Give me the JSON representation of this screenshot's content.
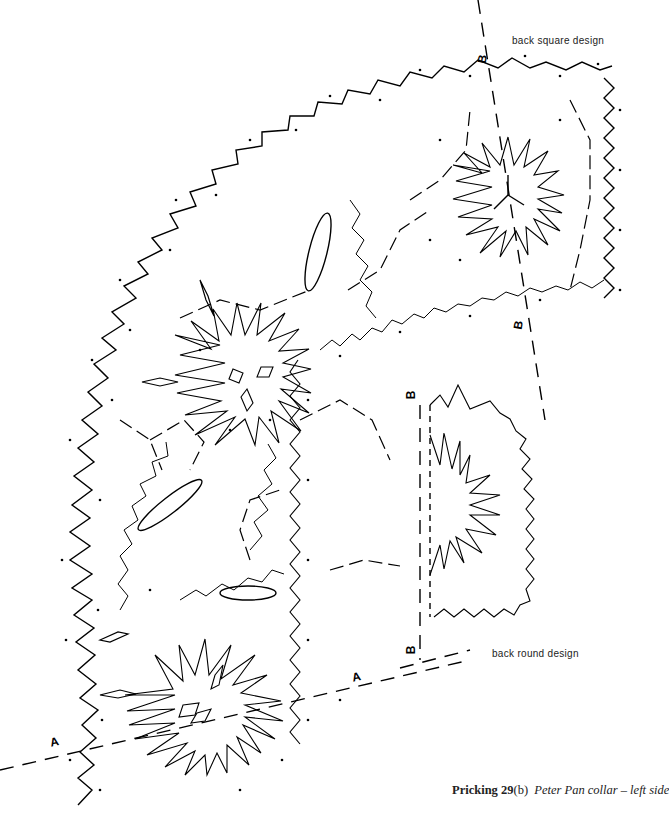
{
  "labels": {
    "back_square": "back square design",
    "back_round": "back round design"
  },
  "markers": {
    "a": "A",
    "b": "B"
  },
  "caption": {
    "prefix": "Pricking ",
    "number": "29",
    "suffix": "(b)",
    "title": "Peter Pan collar – left side"
  },
  "colors": {
    "ink": "#000000",
    "background": "#ffffff"
  }
}
